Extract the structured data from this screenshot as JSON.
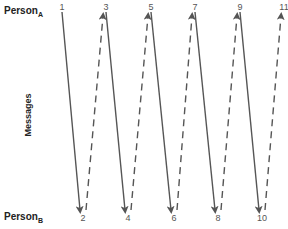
{
  "person_a": {
    "label": "Person",
    "sub": "A"
  },
  "person_b": {
    "label": "Person",
    "sub": "B"
  },
  "axis_label": "Messages",
  "top_numbers": [
    "1",
    "3",
    "5",
    "7",
    "9",
    "11"
  ],
  "bottom_numbers": [
    "2",
    "4",
    "6",
    "8",
    "10"
  ],
  "messages": [
    {
      "from": "1",
      "to": "2",
      "direction": "A-to-B",
      "style": "solid"
    },
    {
      "from": "2",
      "to": "3",
      "direction": "B-to-A",
      "style": "dashed"
    },
    {
      "from": "3",
      "to": "4",
      "direction": "A-to-B",
      "style": "solid"
    },
    {
      "from": "4",
      "to": "5",
      "direction": "B-to-A",
      "style": "dashed"
    },
    {
      "from": "5",
      "to": "6",
      "direction": "A-to-B",
      "style": "solid"
    },
    {
      "from": "6",
      "to": "7",
      "direction": "B-to-A",
      "style": "dashed"
    },
    {
      "from": "7",
      "to": "8",
      "direction": "A-to-B",
      "style": "solid"
    },
    {
      "from": "8",
      "to": "9",
      "direction": "B-to-A",
      "style": "dashed"
    },
    {
      "from": "9",
      "to": "10",
      "direction": "A-to-B",
      "style": "solid"
    },
    {
      "from": "10",
      "to": "11",
      "direction": "B-to-A",
      "style": "dashed"
    }
  ],
  "colors": {
    "line": "#555555",
    "text": "#222222"
  }
}
